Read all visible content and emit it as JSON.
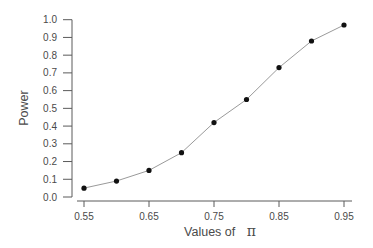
{
  "chart_data": {
    "type": "line",
    "title": "",
    "xlabel": "Values of",
    "xlabel_symbol": "π",
    "ylabel": "Power",
    "x": [
      0.55,
      0.6,
      0.65,
      0.7,
      0.75,
      0.8,
      0.85,
      0.9,
      0.95
    ],
    "series": [
      {
        "name": "Power",
        "values": [
          0.05,
          0.09,
          0.15,
          0.25,
          0.42,
          0.55,
          0.73,
          0.88,
          0.97
        ],
        "markers": true
      }
    ],
    "xticks": [
      "0.55",
      "0.65",
      "0.75",
      "0.85",
      "0.95"
    ],
    "yticks": [
      "0.0",
      "0.1",
      "0.2",
      "0.3",
      "0.4",
      "0.5",
      "0.6",
      "0.7",
      "0.8",
      "0.9",
      "1.0"
    ],
    "xlim": [
      0.55,
      0.95
    ],
    "ylim": [
      0.0,
      1.0
    ],
    "grid": false,
    "legend": null
  },
  "style": {
    "point_color": "#111111",
    "line_color": "#9a9a9a",
    "axis_color": "#5a5a5a",
    "text_color": "#4a4a4a"
  }
}
